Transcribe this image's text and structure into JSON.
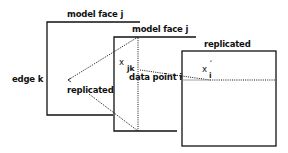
{
  "diagram": {
    "labels": {
      "face_j_1": "model face j",
      "face_j_2": "model face j",
      "replicated_face": "replicated",
      "edge": "edge k",
      "replicated_point": "replicated",
      "data_point": "data point i",
      "x_jk_main": "x",
      "x_jk_sub": "jk",
      "x_i_main": "x",
      "x_i_sub": "i",
      "x_i_prime": "′"
    },
    "colors": {
      "line": "#111111",
      "background": "#ffffff"
    }
  }
}
